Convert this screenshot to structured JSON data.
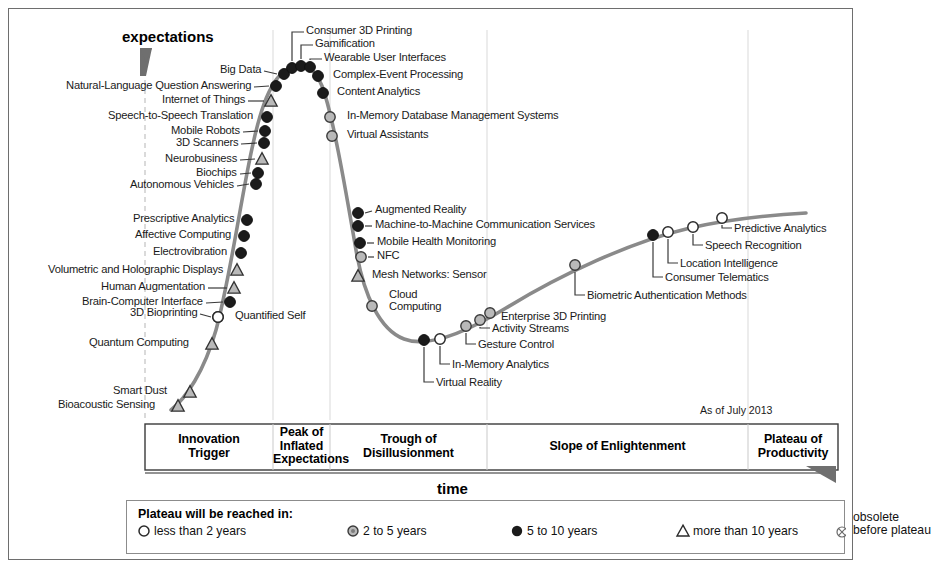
{
  "axes": {
    "y_title": "expectations",
    "x_title": "time",
    "as_of": "As of July 2013"
  },
  "phases": [
    {
      "name": "Innovation Trigger",
      "line1": "Innovation",
      "line2": "Trigger",
      "line3": ""
    },
    {
      "name": "Peak of Inflated Expectations",
      "line1": "Peak of",
      "line2": "Inflated",
      "line3": "Expectations"
    },
    {
      "name": "Trough of Disillusionment",
      "line1": "Trough of",
      "line2": "Disillusionment",
      "line3": ""
    },
    {
      "name": "Slope of Enlightenment",
      "line1": "Slope of Enlightenment",
      "line2": "",
      "line3": ""
    },
    {
      "name": "Plateau of Productivity",
      "line1": "Plateau of",
      "line2": "Productivity",
      "line3": ""
    }
  ],
  "legend": {
    "title": "Plateau will be reached in:",
    "items": [
      {
        "label": "less than 2 years",
        "marker": "open-circle"
      },
      {
        "label": "2 to 5 years",
        "marker": "gray-circle"
      },
      {
        "label": "5 to 10 years",
        "marker": "filled-circle"
      },
      {
        "label": "more than 10 years",
        "marker": "triangle"
      }
    ],
    "obsolete_line1": "obsolete",
    "obsolete_line2": "before plateau",
    "obsolete_marker": "crossed-circle"
  },
  "colors": {
    "curve": "#8a8a8a",
    "frame": "#6e6e6e",
    "marker_dark": "#1b1b1b",
    "marker_gray": "#b9b9b9",
    "text": "#1a1a1a"
  },
  "chart_data": {
    "type": "line",
    "xlabel": "time",
    "ylabel": "expectations",
    "grid": false,
    "legend_position": "bottom",
    "as_of": "As of July 2013",
    "phase_boundaries_px": [
      145,
      273,
      330,
      487,
      748,
      838
    ],
    "points": [
      {
        "label": "Bioacoustic Sensing",
        "marker": "triangle",
        "x": 178,
        "y": 406,
        "side": "left",
        "anchor_x": 158,
        "anchor_y": 406
      },
      {
        "label": "Smart Dust",
        "marker": "triangle",
        "x": 190,
        "y": 392,
        "side": "left",
        "anchor_x": 170,
        "anchor_y": 392
      },
      {
        "label": "Quantum Computing",
        "marker": "triangle",
        "x": 212,
        "y": 344,
        "side": "left",
        "anchor_x": 192,
        "anchor_y": 344
      },
      {
        "label": "3D Bioprinting",
        "marker": "open-circle",
        "x": 218,
        "y": 317,
        "side": "left-leader",
        "anchor_x": 200,
        "anchor_y": 314
      },
      {
        "label": "Quantified Self",
        "marker": "open-circle",
        "x": 218,
        "y": 317,
        "side": "right",
        "anchor_x": 232,
        "anchor_y": 317
      },
      {
        "label": "Brain-Computer Interface",
        "marker": "filled-circle",
        "x": 230,
        "y": 302,
        "side": "left-leader",
        "anchor_x": 206,
        "anchor_y": 303
      },
      {
        "label": "Human Augmentation",
        "marker": "triangle",
        "x": 234,
        "y": 288,
        "side": "left-leader",
        "anchor_x": 208,
        "anchor_y": 288
      },
      {
        "label": "Volumetric and Holographic Displays",
        "marker": "triangle",
        "x": 237,
        "y": 270,
        "side": "left",
        "anchor_x": 226,
        "anchor_y": 271
      },
      {
        "label": "Electrovibration",
        "marker": "filled-circle",
        "x": 241,
        "y": 253,
        "side": "left",
        "anchor_x": 230,
        "anchor_y": 253
      },
      {
        "label": "Affective Computing",
        "marker": "filled-circle",
        "x": 244,
        "y": 236,
        "side": "left",
        "anchor_x": 234,
        "anchor_y": 236
      },
      {
        "label": "Prescriptive Analytics",
        "marker": "filled-circle",
        "x": 247,
        "y": 220,
        "side": "left",
        "anchor_x": 237,
        "anchor_y": 220
      },
      {
        "label": "Autonomous Vehicles",
        "marker": "filled-circle",
        "x": 256,
        "y": 184,
        "side": "left-leader",
        "anchor_x": 237,
        "anchor_y": 186
      },
      {
        "label": "Biochips",
        "marker": "filled-circle",
        "x": 258,
        "y": 173,
        "side": "left-leader",
        "anchor_x": 240,
        "anchor_y": 174
      },
      {
        "label": "Neurobusiness",
        "marker": "triangle",
        "x": 262,
        "y": 159,
        "side": "left-leader",
        "anchor_x": 240,
        "anchor_y": 160
      },
      {
        "label": "3D Scanners",
        "marker": "filled-circle",
        "x": 264,
        "y": 143,
        "side": "left-leader",
        "anchor_x": 241,
        "anchor_y": 144
      },
      {
        "label": "Mobile Robots",
        "marker": "filled-circle",
        "x": 265,
        "y": 131,
        "side": "left-leader",
        "anchor_x": 243,
        "anchor_y": 132
      },
      {
        "label": "Speech-to-Speech Translation",
        "marker": "filled-circle",
        "x": 267,
        "y": 117,
        "side": "left",
        "anchor_x": 256,
        "anchor_y": 117
      },
      {
        "label": "Internet of Things",
        "marker": "triangle",
        "x": 271,
        "y": 101,
        "side": "left-leader",
        "anchor_x": 248,
        "anchor_y": 101
      },
      {
        "label": "Natural-Language Question Answering",
        "marker": "filled-circle",
        "x": 276,
        "y": 86,
        "side": "left-leader",
        "anchor_x": 254,
        "anchor_y": 87
      },
      {
        "label": "Big Data",
        "marker": "filled-circle",
        "x": 284,
        "y": 74,
        "side": "left-leader",
        "anchor_x": 264,
        "anchor_y": 71
      },
      {
        "label": "Consumer 3D Printing",
        "marker": "filled-circle",
        "x": 292,
        "y": 68,
        "side": "top-leader",
        "anchor_x": 292,
        "anchor_y": 28
      },
      {
        "label": "Gamification",
        "marker": "filled-circle",
        "x": 301,
        "y": 66,
        "side": "top-leader",
        "anchor_x": 301,
        "anchor_y": 41
      },
      {
        "label": "Wearable User Interfaces",
        "marker": "filled-circle",
        "x": 310,
        "y": 67,
        "side": "top-leader",
        "anchor_x": 310,
        "anchor_y": 55
      },
      {
        "label": "Complex-Event Processing",
        "marker": "filled-circle",
        "x": 318,
        "y": 76,
        "side": "right",
        "anchor_x": 330,
        "anchor_y": 76
      },
      {
        "label": "Content Analytics",
        "marker": "filled-circle",
        "x": 323,
        "y": 93,
        "side": "right",
        "anchor_x": 334,
        "anchor_y": 93
      },
      {
        "label": "In-Memory Database Management Systems",
        "marker": "gray-circle",
        "x": 330,
        "y": 117,
        "side": "right",
        "anchor_x": 344,
        "anchor_y": 117
      },
      {
        "label": "Virtual Assistants",
        "marker": "gray-circle",
        "x": 332,
        "y": 136,
        "side": "right",
        "anchor_x": 344,
        "anchor_y": 136
      },
      {
        "label": "Augmented Reality",
        "marker": "filled-circle",
        "x": 358,
        "y": 213,
        "side": "right-leader",
        "anchor_x": 372,
        "anchor_y": 211
      },
      {
        "label": "Machine-to-Machine Communication Services",
        "marker": "filled-circle",
        "x": 358,
        "y": 226,
        "side": "right-leader",
        "anchor_x": 372,
        "anchor_y": 226
      },
      {
        "label": "Mobile Health Monitoring",
        "marker": "filled-circle",
        "x": 360,
        "y": 243,
        "side": "right-leader",
        "anchor_x": 374,
        "anchor_y": 243
      },
      {
        "label": "NFC",
        "marker": "gray-circle",
        "x": 361,
        "y": 257,
        "side": "right-leader",
        "anchor_x": 374,
        "anchor_y": 257
      },
      {
        "label": "Mesh Networks: Sensor",
        "marker": "triangle",
        "x": 358,
        "y": 276,
        "side": "right",
        "anchor_x": 369,
        "anchor_y": 276
      },
      {
        "label": "Cloud Computing",
        "marker": "gray-circle",
        "x": 372,
        "y": 306,
        "side": "right",
        "anchor_x": 386,
        "anchor_y": 302
      },
      {
        "label": "Virtual Reality",
        "marker": "filled-circle",
        "x": 424,
        "y": 340,
        "side": "below-leader",
        "anchor_x": 424,
        "anchor_y": 386
      },
      {
        "label": "In-Memory Analytics",
        "marker": "open-circle",
        "x": 440,
        "y": 339,
        "side": "below-leader",
        "anchor_x": 440,
        "anchor_y": 368
      },
      {
        "label": "Gesture Control",
        "marker": "gray-circle",
        "x": 466,
        "y": 326,
        "side": "below-leader",
        "anchor_x": 466,
        "anchor_y": 348
      },
      {
        "label": "Activity Streams",
        "marker": "gray-circle",
        "x": 480,
        "y": 320,
        "side": "below-leader",
        "anchor_x": 480,
        "anchor_y": 332
      },
      {
        "label": "Enterprise 3D Printing",
        "marker": "gray-circle",
        "x": 490,
        "y": 313,
        "side": "right",
        "anchor_x": 498,
        "anchor_y": 318
      },
      {
        "label": "Biometric Authentication Methods",
        "marker": "gray-circle",
        "x": 575,
        "y": 265,
        "side": "below-leader",
        "anchor_x": 575,
        "anchor_y": 299
      },
      {
        "label": "Consumer Telematics",
        "marker": "filled-circle",
        "x": 653,
        "y": 235,
        "side": "below-leader",
        "anchor_x": 653,
        "anchor_y": 281
      },
      {
        "label": "Location Intelligence",
        "marker": "open-circle",
        "x": 668,
        "y": 232,
        "side": "below-leader",
        "anchor_x": 668,
        "anchor_y": 267
      },
      {
        "label": "Speech Recognition",
        "marker": "open-circle",
        "x": 693,
        "y": 227,
        "side": "below-leader",
        "anchor_x": 693,
        "anchor_y": 249
      },
      {
        "label": "Predictive Analytics",
        "marker": "open-circle",
        "x": 722,
        "y": 218,
        "side": "below-leader",
        "anchor_x": 722,
        "anchor_y": 232
      }
    ]
  }
}
